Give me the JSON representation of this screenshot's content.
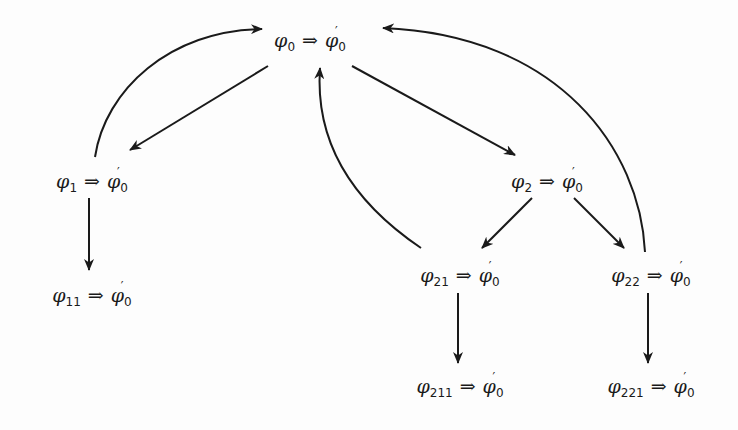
{
  "diagram": {
    "type": "directed-graph",
    "stroke_color": "#1a1a1a",
    "background_color": "#fdfdfd",
    "nodes": [
      {
        "id": "n0",
        "lhs_symbol": "φ",
        "lhs_sub": "0",
        "implies": "⇒",
        "rhs_symbol": "φ",
        "rhs_prime": "′",
        "rhs_sub": "0",
        "x": 310,
        "y": 42
      },
      {
        "id": "n1",
        "lhs_symbol": "φ",
        "lhs_sub": "1",
        "implies": "⇒",
        "rhs_symbol": "φ",
        "rhs_prime": "′",
        "rhs_sub": "0",
        "x": 92,
        "y": 183
      },
      {
        "id": "n11",
        "lhs_symbol": "φ",
        "lhs_sub": "11",
        "implies": "⇒",
        "rhs_symbol": "φ",
        "rhs_prime": "′",
        "rhs_sub": "0",
        "x": 92,
        "y": 297
      },
      {
        "id": "n2",
        "lhs_symbol": "φ",
        "lhs_sub": "2",
        "implies": "⇒",
        "rhs_symbol": "φ",
        "rhs_prime": "′",
        "rhs_sub": "0",
        "x": 547,
        "y": 183
      },
      {
        "id": "n21",
        "lhs_symbol": "φ",
        "lhs_sub": "21",
        "implies": "⇒",
        "rhs_symbol": "φ",
        "rhs_prime": "′",
        "rhs_sub": "0",
        "x": 460,
        "y": 277
      },
      {
        "id": "n22",
        "lhs_symbol": "φ",
        "lhs_sub": "22",
        "implies": "⇒",
        "rhs_symbol": "φ",
        "rhs_prime": "′",
        "rhs_sub": "0",
        "x": 651,
        "y": 277
      },
      {
        "id": "n211",
        "lhs_symbol": "φ",
        "lhs_sub": "211",
        "implies": "⇒",
        "rhs_symbol": "φ",
        "rhs_prime": "′",
        "rhs_sub": "0",
        "x": 460,
        "y": 388
      },
      {
        "id": "n221",
        "lhs_symbol": "φ",
        "lhs_sub": "221",
        "implies": "⇒",
        "rhs_symbol": "φ",
        "rhs_prime": "′",
        "rhs_sub": "0",
        "x": 651,
        "y": 388
      }
    ],
    "edges": [
      {
        "from": "n0",
        "to": "n1",
        "kind": "straight",
        "path": "M 268 66 L 130 150"
      },
      {
        "from": "n0",
        "to": "n2",
        "kind": "straight",
        "path": "M 352 66 L 515 155"
      },
      {
        "from": "n1",
        "to": "n11",
        "kind": "straight",
        "path": "M 89 198 L 89 270"
      },
      {
        "from": "n2",
        "to": "n21",
        "kind": "straight",
        "path": "M 532 198 L 482 248"
      },
      {
        "from": "n2",
        "to": "n22",
        "kind": "straight",
        "path": "M 574 198 L 624 248"
      },
      {
        "from": "n21",
        "to": "n211",
        "kind": "straight",
        "path": "M 458 293 L 458 363"
      },
      {
        "from": "n22",
        "to": "n221",
        "kind": "straight",
        "path": "M 648 293 L 648 363"
      },
      {
        "from": "n1",
        "to": "n0",
        "kind": "curve",
        "path": "M 95 157 C 105 90, 170 30, 262 29"
      },
      {
        "from": "n21",
        "to": "n0",
        "kind": "curve",
        "path": "M 421 248 C 350 200, 315 140, 320 68"
      },
      {
        "from": "n22",
        "to": "n0",
        "kind": "curve",
        "path": "M 645 252 C 640 150, 560 35, 383 28"
      }
    ]
  }
}
